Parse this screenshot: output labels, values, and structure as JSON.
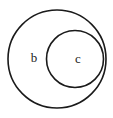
{
  "diagram": {
    "type": "euler-diagram",
    "background_color": "#ffffff",
    "stroke_color": "#1a1a1a",
    "fill_color": "#ffffff",
    "canvas": {
      "width": 113,
      "height": 118
    },
    "sets": [
      {
        "id": "outer",
        "label": "b",
        "cx": 57,
        "cy": 59,
        "r": 49,
        "stroke_width": 1.6,
        "label_x": 34,
        "label_y": 59,
        "label_font_size": 13
      },
      {
        "id": "inner",
        "label": "c",
        "cx": 75,
        "cy": 59,
        "r": 28.5,
        "stroke_width": 1.6,
        "label_x": 78,
        "label_y": 60,
        "label_font_size": 12
      }
    ]
  },
  "chart_data": {
    "type": "diagram",
    "subtype": "euler",
    "title": "",
    "labels": [
      "b",
      "c"
    ],
    "relation": "c ⊂ b",
    "nodes": [
      {
        "name": "b",
        "containment_depth": 0,
        "radius": 49
      },
      {
        "name": "c",
        "containment_depth": 1,
        "radius": 28.5
      }
    ]
  }
}
